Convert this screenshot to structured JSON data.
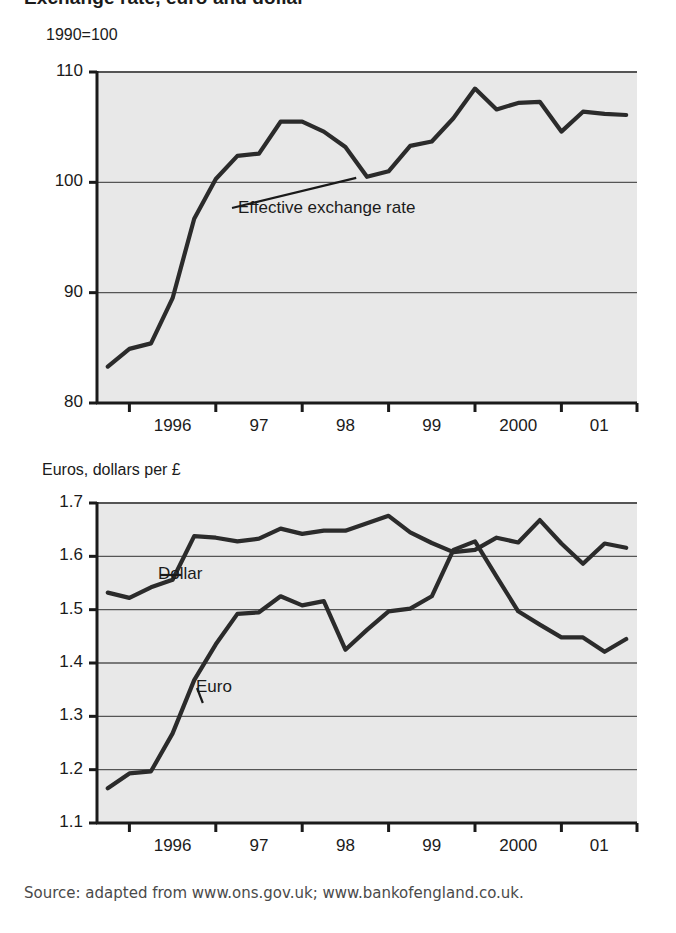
{
  "figure": {
    "title": "Exchange rate, euro and dollar",
    "source": "Source: adapted from www.ons.gov.uk; www.bankofengland.co.uk.",
    "plot_background": "#e8e8e8",
    "line_color": "#2b2b2b",
    "grid_color": "#555555",
    "axis_color": "#1a1a1a"
  },
  "chart_data": [
    {
      "id": "effective-exchange-rate",
      "type": "line",
      "title": "Exchange rate, euro and dollar",
      "subtitle": "1990=100",
      "ylabel": "1990=100",
      "xlabel": "",
      "ylim": [
        80,
        110
      ],
      "yticks": [
        80,
        90,
        100,
        110
      ],
      "ytick_labels": [
        "80",
        "90",
        "100",
        "110"
      ],
      "xlim": [
        1995.625,
        2001.875
      ],
      "xticks": [
        1996,
        1997,
        1998,
        1999,
        2000,
        2001
      ],
      "xtick_labels": [
        "1996",
        "97",
        "98",
        "99",
        "2000",
        "01"
      ],
      "grid": "horizontal",
      "legend": "none",
      "annotations": [
        {
          "text": "Effective exchange rate",
          "points_to_x": 1998.625,
          "points_to_y": 100.4
        }
      ],
      "series": [
        {
          "name": "Effective exchange rate",
          "x": [
            1995.75,
            1996.0,
            1996.25,
            1996.5,
            1996.75,
            1997.0,
            1997.25,
            1997.5,
            1997.75,
            1998.0,
            1998.25,
            1998.5,
            1998.75,
            1999.0,
            1999.25,
            1999.5,
            1999.75,
            2000.0,
            2000.25,
            2000.5,
            2000.75,
            2001.0,
            2001.25,
            2001.5,
            2001.75
          ],
          "values": [
            83.3,
            84.9,
            85.4,
            89.5,
            96.7,
            100.3,
            102.4,
            102.6,
            105.5,
            105.5,
            104.6,
            103.2,
            100.5,
            101.0,
            103.3,
            103.7,
            105.8,
            108.5,
            106.6,
            107.2,
            107.3,
            104.6,
            106.4,
            106.2,
            106.1
          ]
        }
      ]
    },
    {
      "id": "euros-dollars-per-pound",
      "type": "line",
      "title": "",
      "subtitle": "Euros, dollars per £",
      "ylabel": "Euros, dollars per £",
      "xlabel": "",
      "ylim": [
        1.1,
        1.7
      ],
      "yticks": [
        1.1,
        1.2,
        1.3,
        1.4,
        1.5,
        1.6,
        1.7
      ],
      "ytick_labels": [
        "1.1",
        "1.2",
        "1.3",
        "1.4",
        "1.5",
        "1.6",
        "1.7"
      ],
      "xlim": [
        1995.625,
        2001.875
      ],
      "xticks": [
        1996,
        1997,
        1998,
        1999,
        2000,
        2001
      ],
      "xtick_labels": [
        "1996",
        "97",
        "98",
        "99",
        "2000",
        "01"
      ],
      "grid": "horizontal",
      "legend": "inline-labels",
      "annotations": [
        {
          "text": "Dollar",
          "points_to_x": 1996.6,
          "points_to_y": 1.565
        },
        {
          "text": "Euro",
          "points_to_x": 1996.85,
          "points_to_y": 1.325
        }
      ],
      "series": [
        {
          "name": "Dollar",
          "x": [
            1995.75,
            1996.0,
            1996.25,
            1996.5,
            1996.75,
            1997.0,
            1997.25,
            1997.5,
            1997.75,
            1998.0,
            1998.25,
            1998.5,
            1998.75,
            1999.0,
            1999.25,
            1999.5,
            1999.75,
            2000.0,
            2000.25,
            2000.5,
            2000.75,
            2001.0,
            2001.25,
            2001.5,
            2001.75
          ],
          "values": [
            1.532,
            1.522,
            1.542,
            1.556,
            1.638,
            1.635,
            1.628,
            1.633,
            1.652,
            1.642,
            1.648,
            1.648,
            1.662,
            1.676,
            1.645,
            1.625,
            1.608,
            1.612,
            1.635,
            1.626,
            1.668,
            1.624,
            1.586,
            1.624,
            1.616
          ]
        },
        {
          "name": "Euro",
          "x": [
            1995.75,
            1996.0,
            1996.25,
            1996.5,
            1996.75,
            1997.0,
            1997.25,
            1997.5,
            1997.75,
            1998.0,
            1998.25,
            1998.5,
            1998.75,
            1999.0,
            1999.25,
            1999.5,
            1999.75,
            2000.0,
            2000.25,
            2000.5,
            2000.75,
            2001.0,
            2001.25,
            2001.5,
            2001.75
          ],
          "values": [
            1.165,
            1.193,
            1.197,
            1.268,
            1.368,
            1.435,
            1.492,
            1.495,
            1.525,
            1.508,
            1.516,
            1.425,
            1.462,
            1.497,
            1.502,
            1.525,
            1.612,
            1.628,
            1.562,
            1.497,
            1.472,
            1.448,
            1.448,
            1.421,
            1.445
          ]
        }
      ]
    }
  ]
}
